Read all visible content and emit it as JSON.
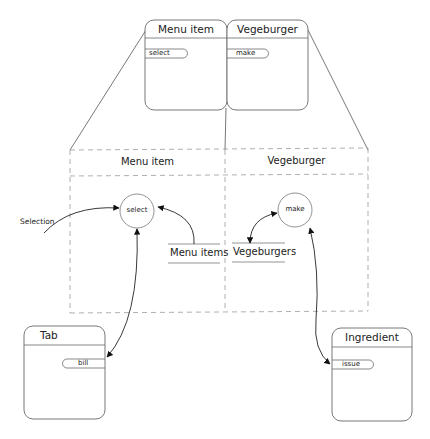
{
  "zoomed_cards": [
    {
      "title": "Menu item",
      "method": "select"
    },
    {
      "title": "Vegeburger",
      "method": "make"
    }
  ],
  "expanded_view": {
    "regions": [
      {
        "title": "Menu item",
        "process": "select",
        "store": "Menu items"
      },
      {
        "title": "Vegeburger",
        "process": "make",
        "store": "Vegeburgers"
      }
    ]
  },
  "external_flow": {
    "label": "Selection"
  },
  "objects": [
    {
      "title": "Tab",
      "method": "bill"
    },
    {
      "title": "Ingredient",
      "method": "issue"
    }
  ],
  "colors": {
    "line": "#444444",
    "dashed": "#9a9a9a",
    "card_border": "#6a6a6a"
  }
}
